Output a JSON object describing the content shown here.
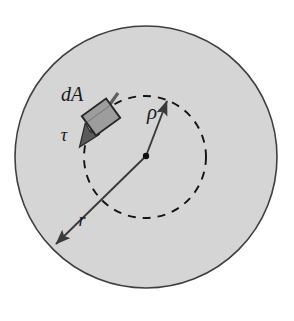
{
  "figure": {
    "background_color": "#ffffff",
    "labels": {
      "area_element": "dA",
      "shear_stress": "τ",
      "inner_radius": "ρ",
      "outer_radius": "r"
    },
    "colors": {
      "disk_fill": "#d5d5d5",
      "disk_outline": "#3f3f3f",
      "dashed_circle": "#141414",
      "arrow": "#3a3a3a",
      "element_fill": "#9a9a9a",
      "element_outline": "#2b2b2b",
      "label_text": "#1a1a1a"
    },
    "geometry": {
      "outer_circle": {
        "cx": 146,
        "cy": 157,
        "r": 131
      },
      "dashed_circle": {
        "cx": 145,
        "cy": 157,
        "r": 61
      },
      "center_dot": {
        "cx": 146,
        "cy": 156,
        "r": 3.2
      },
      "rho_arrow": {
        "x1": 146,
        "y1": 156,
        "x2": 168,
        "y2": 100
      },
      "r_arrow": {
        "x1": 146,
        "y1": 156,
        "x2": 54,
        "y2": 246
      },
      "tau_arrow": {
        "x1": 117,
        "y1": 94,
        "x2": 79,
        "y2": 148
      },
      "area_element": {
        "cx": 101,
        "cy": 117,
        "w": 30,
        "h": 24,
        "rotation": -36
      }
    },
    "label_positions": {
      "dA": {
        "x": 72,
        "y": 96
      },
      "tau": {
        "x": 64,
        "y": 137
      },
      "rho": {
        "x": 152,
        "y": 113
      },
      "r": {
        "x": 82,
        "y": 222
      }
    }
  }
}
